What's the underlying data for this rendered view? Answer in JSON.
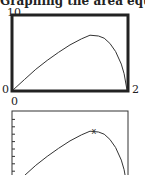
{
  "caption": "Graphing the area equation",
  "chart_data": [
    {
      "type": "line",
      "title": "",
      "xlabel": "",
      "ylabel": "",
      "xlim": [
        0,
        2
      ],
      "ylim": [
        0,
        10
      ],
      "tick_labels": {
        "ymax": "10",
        "ymin": "0",
        "xmin": "0",
        "xmax": "2"
      },
      "grid": false,
      "series": [
        {
          "name": "area",
          "x": [
            0,
            0.2,
            0.4,
            0.6,
            0.8,
            1.0,
            1.2,
            1.35,
            1.5,
            1.6,
            1.7,
            1.8,
            1.9,
            1.95,
            2.0
          ],
          "y": [
            0,
            1.4,
            2.8,
            4.0,
            5.1,
            6.1,
            6.9,
            7.4,
            7.3,
            7.0,
            6.3,
            5.2,
            3.5,
            2.2,
            0
          ]
        }
      ]
    },
    {
      "type": "line",
      "title": "",
      "xlim": [
        0,
        2
      ],
      "ylim": [
        0,
        10
      ],
      "grid": false,
      "marker": {
        "label": "maximum",
        "x": 1.42,
        "y": 7.5,
        "symbol": "x"
      },
      "series": [
        {
          "name": "area",
          "x": [
            0,
            0.2,
            0.4,
            0.6,
            0.8,
            1.0,
            1.2,
            1.35,
            1.5,
            1.6,
            1.7,
            1.8,
            1.9,
            1.95,
            2.0
          ],
          "y": [
            0,
            1.4,
            2.8,
            4.0,
            5.1,
            6.1,
            6.9,
            7.4,
            7.3,
            7.0,
            6.3,
            5.2,
            3.5,
            2.2,
            0
          ]
        }
      ]
    }
  ]
}
